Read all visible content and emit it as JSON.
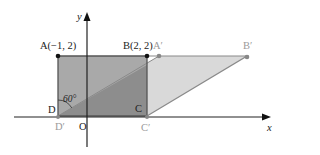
{
  "diagram": {
    "type": "coordinate-geometry-shear",
    "axes": {
      "x_label": "x",
      "y_label": "y",
      "origin_label": "O"
    },
    "points": {
      "A": {
        "label": "A(−1, 2)",
        "coords": [
          -1,
          2
        ]
      },
      "B": {
        "label": "B(2, 2)",
        "coords": [
          2,
          2
        ]
      },
      "C": {
        "label": "C",
        "coords": [
          2,
          0
        ]
      },
      "D": {
        "label": "D",
        "coords": [
          -1,
          0
        ]
      },
      "A_prime": {
        "label": "A′"
      },
      "B_prime": {
        "label": "B′"
      },
      "C_prime": {
        "label": "C′"
      },
      "D_prime": {
        "label": "D′"
      }
    },
    "angle": {
      "label": "60°",
      "vertex": "D"
    },
    "shapes": {
      "rectangle": "ABCD",
      "parallelogram": "A′B′C′D′"
    },
    "colors": {
      "rect_fill": "#a9a9a9",
      "overlap_fill": "#8d8d8d",
      "parallelogram_fill": "#d9d9d9",
      "rect_edge": "#555555",
      "parallelogram_edge": "#8a8a8a",
      "axis": "#222222"
    }
  }
}
